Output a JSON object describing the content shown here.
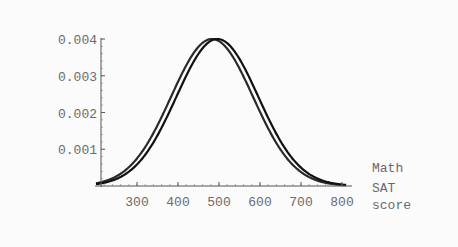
{
  "chart_data": {
    "type": "line",
    "title": "",
    "xlabel": "Math SAT score",
    "xlabel_lines": [
      "Math",
      "SAT",
      "score"
    ],
    "ylabel": "",
    "xlim": [
      200,
      810
    ],
    "ylim": [
      0,
      0.004
    ],
    "x_ticks": [
      300,
      400,
      500,
      600,
      700,
      800
    ],
    "x_tick_labels": [
      "300",
      "400",
      "500",
      "600",
      "700",
      "800"
    ],
    "y_ticks": [
      0.001,
      0.002,
      0.003,
      0.004
    ],
    "y_tick_labels": [
      "0.001",
      "0.002",
      "0.003",
      "0.004"
    ],
    "grid": false,
    "legend": null,
    "series": [
      {
        "name": "curve-1",
        "distribution": "normal",
        "mean": 483,
        "sd": 100,
        "color": "#2a2a2a",
        "peak": 0.004
      },
      {
        "name": "curve-2",
        "distribution": "normal",
        "mean": 496,
        "sd": 100,
        "color": "#111111",
        "peak": 0.004
      }
    ]
  },
  "colors": {
    "background": "#fbfbfb",
    "axis": "#555555",
    "text": "#6a6a6a"
  }
}
